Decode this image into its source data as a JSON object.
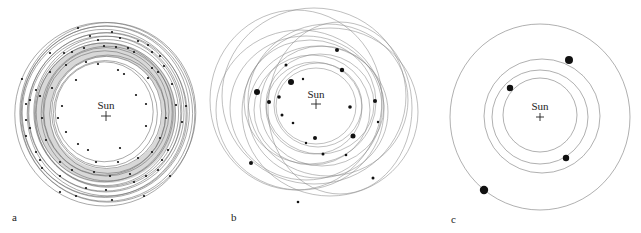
{
  "figure": {
    "panels": [
      {
        "id": "a",
        "label": "a",
        "sun_label": "Sun",
        "center": [
          106,
          115
        ],
        "description": "Dense disk of many overlapping near-circular orbits with numerous small bodies (planetesimals)",
        "orbit_radii": [
          49,
          52,
          55,
          58,
          61,
          63,
          66,
          68,
          70,
          72,
          74,
          76,
          78,
          80,
          82,
          84,
          86,
          88,
          90
        ],
        "bodies": [
          [
            78,
            28
          ],
          [
            112,
            32
          ],
          [
            90,
            36
          ],
          [
            98,
            40
          ],
          [
            120,
            38
          ],
          [
            138,
            41
          ],
          [
            148,
            45
          ],
          [
            50,
            53
          ],
          [
            64,
            53
          ],
          [
            72,
            52
          ],
          [
            84,
            48
          ],
          [
            104,
            46
          ],
          [
            116,
            47
          ],
          [
            128,
            48
          ],
          [
            134,
            52
          ],
          [
            152,
            52
          ],
          [
            160,
            56
          ],
          [
            66,
            65
          ],
          [
            86,
            62
          ],
          [
            98,
            64
          ],
          [
            118,
            70
          ],
          [
            152,
            68
          ],
          [
            158,
            72
          ],
          [
            164,
            66
          ],
          [
            22,
            79
          ],
          [
            50,
            72
          ],
          [
            76,
            80
          ],
          [
            124,
            74
          ],
          [
            148,
            78
          ],
          [
            172,
            84
          ],
          [
            36,
            90
          ],
          [
            40,
            96
          ],
          [
            30,
            100
          ],
          [
            52,
            88
          ],
          [
            62,
            106
          ],
          [
            136,
            95
          ],
          [
            176,
            105
          ],
          [
            26,
            104
          ],
          [
            186,
            106
          ],
          [
            26,
            120
          ],
          [
            30,
            128
          ],
          [
            42,
            118
          ],
          [
            58,
            118
          ],
          [
            146,
            104
          ],
          [
            166,
            118
          ],
          [
            182,
            122
          ],
          [
            26,
            136
          ],
          [
            46,
            140
          ],
          [
            66,
            132
          ],
          [
            78,
            144
          ],
          [
            88,
            150
          ],
          [
            120,
            148
          ],
          [
            146,
            126
          ],
          [
            160,
            138
          ],
          [
            168,
            150
          ],
          [
            36,
            152
          ],
          [
            40,
            160
          ],
          [
            60,
            162
          ],
          [
            72,
            170
          ],
          [
            96,
            162
          ],
          [
            118,
            162
          ],
          [
            138,
            158
          ],
          [
            152,
            152
          ],
          [
            162,
            160
          ],
          [
            42,
            168
          ],
          [
            60,
            176
          ],
          [
            94,
            172
          ],
          [
            110,
            176
          ],
          [
            130,
            174
          ],
          [
            146,
            176
          ],
          [
            158,
            170
          ],
          [
            170,
            176
          ],
          [
            60,
            192
          ],
          [
            76,
            196
          ],
          [
            86,
            188
          ],
          [
            106,
            190
          ],
          [
            112,
            200
          ],
          [
            134,
            182
          ],
          [
            144,
            196
          ]
        ]
      },
      {
        "id": "b",
        "label": "b",
        "sun_label": "Sun",
        "center": [
          316,
          106
        ],
        "description": "Fewer, larger bodies on increasingly eccentric, crossing orbits",
        "orbits": [
          [
            316,
            106,
            40,
            38
          ],
          [
            318,
            105,
            44,
            42
          ],
          [
            314,
            108,
            48,
            46
          ],
          [
            320,
            104,
            54,
            50
          ],
          [
            312,
            110,
            58,
            55
          ],
          [
            322,
            106,
            62,
            60
          ],
          [
            310,
            102,
            66,
            62
          ],
          [
            318,
            112,
            70,
            66
          ],
          [
            306,
            108,
            76,
            72
          ],
          [
            328,
            100,
            80,
            76
          ],
          [
            300,
            110,
            84,
            80
          ],
          [
            330,
            112,
            88,
            84
          ],
          [
            314,
            96,
            92,
            88
          ],
          [
            296,
            100,
            86,
            90
          ],
          [
            340,
            108,
            72,
            86
          ]
        ],
        "bodies": [
          {
            "x": 337,
            "y": 50,
            "r": 2
          },
          {
            "x": 286,
            "y": 65,
            "r": 1.5
          },
          {
            "x": 291,
            "y": 82,
            "r": 3
          },
          {
            "x": 303,
            "y": 79,
            "r": 1.2
          },
          {
            "x": 342,
            "y": 70,
            "r": 2.2
          },
          {
            "x": 257,
            "y": 92,
            "r": 3
          },
          {
            "x": 279,
            "y": 97,
            "r": 1.8
          },
          {
            "x": 269,
            "y": 102,
            "r": 2
          },
          {
            "x": 350,
            "y": 107,
            "r": 1.8
          },
          {
            "x": 282,
            "y": 115,
            "r": 1.5
          },
          {
            "x": 375,
            "y": 101,
            "r": 2
          },
          {
            "x": 293,
            "y": 123,
            "r": 1.3
          },
          {
            "x": 315,
            "y": 138,
            "r": 2
          },
          {
            "x": 306,
            "y": 143,
            "r": 1.2
          },
          {
            "x": 353,
            "y": 136,
            "r": 2.5
          },
          {
            "x": 323,
            "y": 154,
            "r": 1.5
          },
          {
            "x": 346,
            "y": 155,
            "r": 1.3
          },
          {
            "x": 251,
            "y": 163,
            "r": 2
          },
          {
            "x": 373,
            "y": 178,
            "r": 1.5
          },
          {
            "x": 298,
            "y": 202,
            "r": 1.3
          },
          {
            "x": 378,
            "y": 122,
            "r": 1.2
          }
        ]
      },
      {
        "id": "c",
        "label": "c",
        "sun_label": "Sun",
        "center": [
          540,
          117
        ],
        "description": "Final state: a few planets on well-separated orbits",
        "orbits": [
          [
            540,
            115,
            37,
            37
          ],
          [
            540,
            117,
            48,
            47
          ],
          [
            542,
            116,
            58,
            57
          ],
          [
            540,
            117,
            90,
            93
          ]
        ],
        "bodies": [
          {
            "x": 569,
            "y": 60,
            "r": 4
          },
          {
            "x": 510,
            "y": 88,
            "r": 3.2
          },
          {
            "x": 566,
            "y": 158,
            "r": 3.2
          },
          {
            "x": 484,
            "y": 190,
            "r": 4.2
          }
        ]
      }
    ]
  }
}
